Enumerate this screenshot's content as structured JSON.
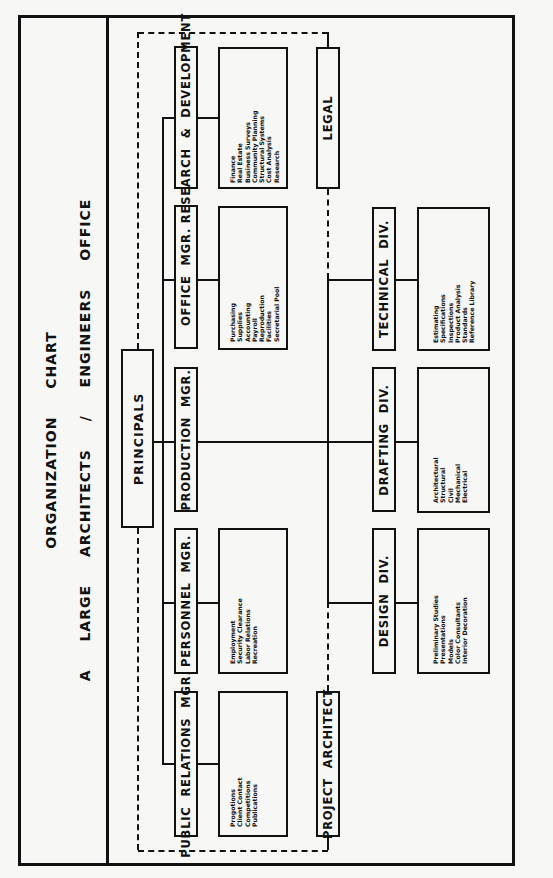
{
  "title": {
    "line1": "ORGANIZATION CHART",
    "line2": "A LARGE ARCHITECTS / ENGINEERS OFFICE"
  },
  "top": {
    "label": "PRINCIPALS"
  },
  "managers": [
    {
      "label": "RESEARCH & DEVELOPMENT",
      "functions": [
        "Finance",
        "Real Estate",
        "Business Surveys",
        "Community Planning",
        "Structural Systems",
        "Cost Analysis",
        "Research"
      ]
    },
    {
      "label": "OFFICE MGR.",
      "functions": [
        "Purchasing",
        "Supplies",
        "Accounting",
        "Payroll",
        "Reproduction",
        "Facilities",
        "Secretarial Pool"
      ]
    },
    {
      "label": "PRODUCTION MGR.",
      "functions": []
    },
    {
      "label": "PERSONNEL MGR.",
      "functions": [
        "Employment",
        "Security Clearance",
        "Labor Relations",
        "Recreation"
      ]
    },
    {
      "label": "PUBLIC RELATIONS MGR.",
      "functions": [
        "Progotions",
        "Client Contact",
        "Competitions",
        "Publications"
      ]
    }
  ],
  "staff": {
    "legal": "LEGAL",
    "project_architect": "PROJECT ARCHITECT"
  },
  "divisions": [
    {
      "label": "TECHNICAL DIV.",
      "functions": [
        "Estimating",
        "Specifications",
        "Inspections",
        "Product Analysis",
        "Standards",
        "Reference Library"
      ]
    },
    {
      "label": "DRAFTING DIV.",
      "functions": [
        "Architectural",
        "Structural",
        "Civil",
        "Mechanical",
        "Electrical"
      ]
    },
    {
      "label": "DESIGN DIV.",
      "functions": [
        "Preliminary Studies",
        "Presentations",
        "Models",
        "Color Consultants",
        "Interior Decoration"
      ]
    }
  ]
}
